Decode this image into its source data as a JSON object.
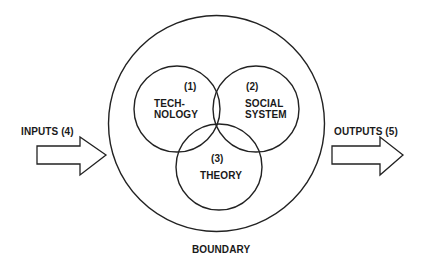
{
  "diagram": {
    "type": "venn-system-model",
    "boundary": {
      "label": "BOUNDARY",
      "shape": "circle"
    },
    "components": [
      {
        "number": "(1)",
        "label_line1": "TECH-",
        "label_line2": "NOLOGY"
      },
      {
        "number": "(2)",
        "label_line1": "SOCIAL",
        "label_line2": "SYSTEM"
      },
      {
        "number": "(3)",
        "label_line1": "THEORY",
        "label_line2": ""
      }
    ],
    "inputs": {
      "label": "INPUTS (4)",
      "direction": "into-boundary"
    },
    "outputs": {
      "label": "OUTPUTS (5)",
      "direction": "out-of-boundary"
    }
  },
  "colors": {
    "stroke": "#222222",
    "background": "#ffffff",
    "text": "#1a1a1a"
  }
}
